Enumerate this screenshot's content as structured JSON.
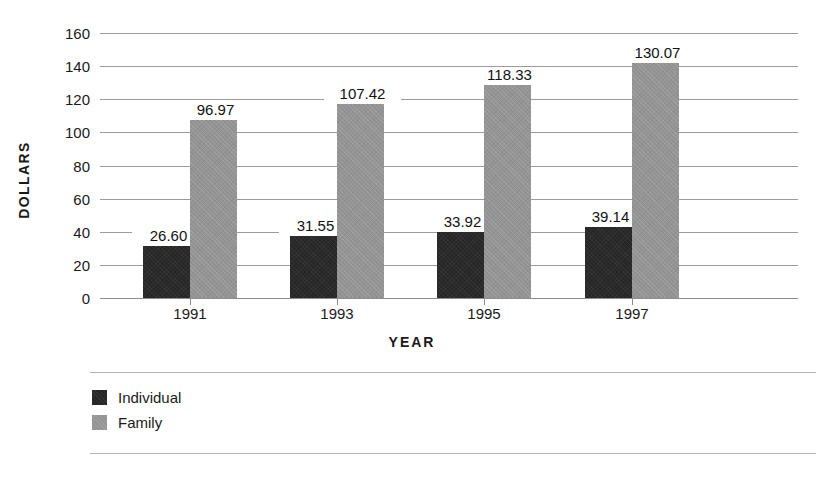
{
  "chart_data": {
    "type": "bar",
    "title": "",
    "subtitle": "",
    "xlabel": "YEAR",
    "ylabel": "DOLLARS",
    "categories": [
      "1991",
      "1993",
      "1995",
      "1997"
    ],
    "series": [
      {
        "name": "Individual",
        "color": "#262626",
        "values": [
          26.6,
          31.55,
          33.92,
          39.14
        ],
        "labels": [
          "26.60",
          "31.55",
          "33.92",
          "39.14"
        ]
      },
      {
        "name": "Family",
        "color": "#949494",
        "values": [
          96.97,
          107.42,
          118.33,
          130.07
        ],
        "labels": [
          "96.97",
          "107.42",
          "118.33",
          "130.07"
        ]
      }
    ],
    "ylim": [
      0,
      160
    ],
    "ytick_labels": [
      "160",
      "140",
      "120",
      "100",
      "80",
      "60",
      "40",
      "20",
      "0"
    ],
    "ytick_values": [
      160,
      140,
      120,
      100,
      80,
      60,
      40,
      20,
      0
    ],
    "grid": true,
    "legend_position": "bottom-left",
    "bar_pixel_heights": {
      "individual": [
        52,
        62,
        66,
        71
      ],
      "family": [
        178,
        194,
        213,
        235
      ]
    }
  },
  "axes": {
    "y_title": "DOLLARS",
    "x_title": "YEAR"
  },
  "legend": {
    "items": [
      {
        "label": "Individual",
        "swatch": "dark-square-swatch"
      },
      {
        "label": "Family",
        "swatch": "gray-square-swatch"
      }
    ]
  }
}
